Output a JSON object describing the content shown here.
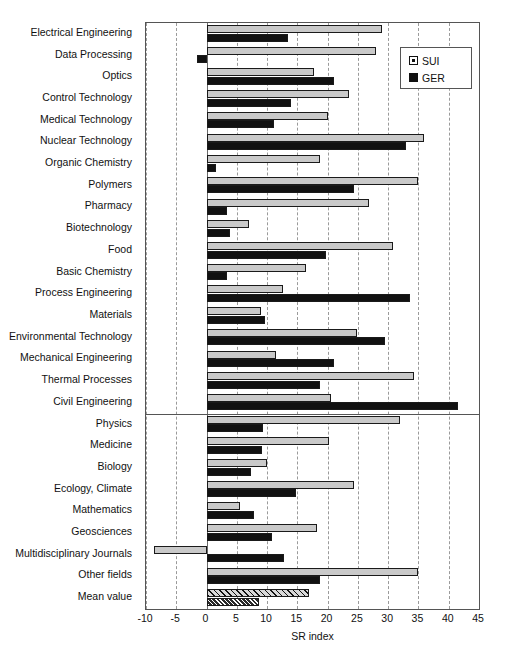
{
  "chart_data": {
    "type": "bar",
    "orientation": "horizontal",
    "title": "",
    "xlabel": "SR index",
    "ylabel": "",
    "xlim": [
      -10,
      45
    ],
    "xticks": [
      -10,
      -5,
      0,
      5,
      10,
      15,
      20,
      25,
      30,
      35,
      40,
      45
    ],
    "xtick_labels": [
      "-10",
      "-5",
      "0",
      "5",
      "10",
      "15",
      "20",
      "25",
      "30",
      "35",
      "40",
      "45"
    ],
    "grid": "vertical-dashed",
    "legend_position": "top-right",
    "categories": [
      "Electrical Engineering",
      "Data Processing",
      "Optics",
      "Control Technology",
      "Medical Technology",
      "Nuclear Technology",
      "Organic Chemistry",
      "Polymers",
      "Pharmacy",
      "Biotechnology",
      "Food",
      "Basic Chemistry",
      "Process Engineering",
      "Materials",
      "Environmental Technology",
      "Mechanical Engineering",
      "Thermal Processes",
      "Civil Engineering",
      "Physics",
      "Medicine",
      "Biology",
      "Ecology, Climate",
      "Mathematics",
      "Geosciences",
      "Multidisciplinary Journals",
      "Other fields",
      "Mean value"
    ],
    "series": [
      {
        "name": "SUI",
        "color": "#c9c9c9",
        "values": [
          28.9,
          28.0,
          17.7,
          23.6,
          20.0,
          35.9,
          18.8,
          34.9,
          26.9,
          7.0,
          30.8,
          16.4,
          12.6,
          9.0,
          24.8,
          11.5,
          34.3,
          20.5,
          32.0,
          20.2,
          10.0,
          24.3,
          5.6,
          18.2,
          -8.7,
          34.9,
          17.0
        ]
      },
      {
        "name": "GER",
        "color": "#111111",
        "values": [
          13.4,
          -1.5,
          21.1,
          13.9,
          11.2,
          33.0,
          1.5,
          24.4,
          3.4,
          3.8,
          19.8,
          3.4,
          33.6,
          9.7,
          29.5,
          21.0,
          18.7,
          41.6,
          9.4,
          9.2,
          7.4,
          14.8,
          7.9,
          10.8,
          12.8,
          18.7,
          8.7
        ]
      }
    ],
    "group_separator_after_category": "Civil Engineering",
    "highlight_row": "Mean value",
    "highlight_style": "hatched"
  },
  "legend": {
    "items": [
      {
        "label": "SUI",
        "swatch": "light-gray-square"
      },
      {
        "label": "GER",
        "swatch": "black-square"
      }
    ]
  },
  "axis": {
    "x_title": "SR index"
  }
}
